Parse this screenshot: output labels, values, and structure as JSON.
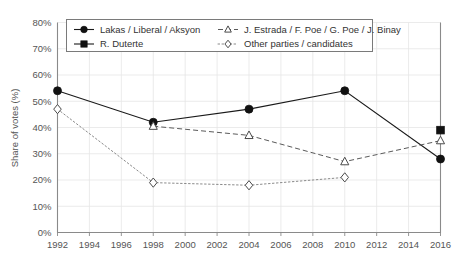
{
  "chart_data": {
    "type": "line",
    "title": "",
    "xlabel": "",
    "ylabel": "Share of votes (%)",
    "xlim": [
      1992,
      2016
    ],
    "ylim": [
      0,
      80
    ],
    "grid": true,
    "legend_position": "top-inside",
    "x_tick_labels": [
      "1992",
      "1994",
      "1996",
      "1998",
      "2000",
      "2002",
      "2004",
      "2006",
      "2008",
      "2010",
      "2012",
      "2014",
      "2016"
    ],
    "x_ticks": [
      1992,
      1994,
      1996,
      1998,
      2000,
      2002,
      2004,
      2006,
      2008,
      2010,
      2012,
      2014,
      2016
    ],
    "y_tick_labels": [
      "0%",
      "10%",
      "20%",
      "30%",
      "40%",
      "50%",
      "60%",
      "70%",
      "80%"
    ],
    "y_ticks": [
      0,
      10,
      20,
      30,
      40,
      50,
      60,
      70,
      80
    ],
    "series": [
      {
        "name": "Lakas / Liberal / Aksyon",
        "marker": "filled-circle",
        "line_style": "solid",
        "color": "#111111",
        "x": [
          1992,
          1998,
          2004,
          2010,
          2016
        ],
        "values": [
          54,
          42,
          47,
          54,
          28
        ]
      },
      {
        "name": "R. Duterte",
        "marker": "filled-square",
        "line_style": "solid",
        "color": "#111111",
        "x": [
          2016
        ],
        "values": [
          39
        ]
      },
      {
        "name": "J. Estrada / F. Poe / G. Poe / J. Binay",
        "marker": "open-triangle",
        "line_style": "dashed",
        "color": "#5a5a5a",
        "x": [
          1998,
          2004,
          2010,
          2016
        ],
        "values": [
          40.5,
          37,
          27,
          35
        ]
      },
      {
        "name": "Other parties / candidates",
        "marker": "open-diamond",
        "line_style": "dotted",
        "color": "#8a8a8a",
        "x": [
          1992,
          1998,
          2004,
          2010
        ],
        "values": [
          47,
          19,
          18,
          21
        ]
      }
    ]
  },
  "legend": {
    "entries": [
      {
        "label": "Lakas / Liberal / Aksyon",
        "marker": "filled-circle",
        "line_style": "solid"
      },
      {
        "label": "J. Estrada / F. Poe / G. Poe / J. Binay",
        "marker": "open-triangle",
        "line_style": "dashed"
      },
      {
        "label": "R. Duterte",
        "marker": "filled-square",
        "line_style": "solid"
      },
      {
        "label": "Other parties / candidates",
        "marker": "open-diamond",
        "line_style": "dotted"
      }
    ]
  },
  "colors": {
    "background": "#ffffff",
    "axis": "#8a8a8a",
    "grid": "#e6e6e6",
    "text": "#555555",
    "primary_series": "#111111"
  }
}
